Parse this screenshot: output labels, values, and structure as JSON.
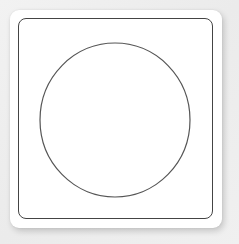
{
  "figure": {
    "card": {
      "fill": "#ffffff",
      "shadow": true
    },
    "frame": {
      "stroke": "#444444",
      "shape": "rounded-square"
    },
    "circle": {
      "stroke": "#555555",
      "fill": "none",
      "cx": 115,
      "cy": 120,
      "rx": 75,
      "ry": 77
    }
  }
}
